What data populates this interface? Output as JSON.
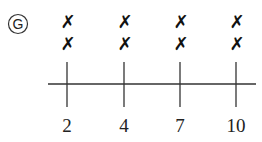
{
  "option_label": "G",
  "line_plot": {
    "axis": {
      "x_start": 48,
      "x_end": 256,
      "y": 84
    },
    "ticks": [
      {
        "label": "2",
        "x": 67,
        "count": 2
      },
      {
        "label": "4",
        "x": 124,
        "count": 2
      },
      {
        "label": "7",
        "x": 180,
        "count": 2
      },
      {
        "label": "10",
        "x": 236,
        "count": 2
      }
    ],
    "mark_symbol": "✗"
  },
  "chart_data": {
    "type": "scatter",
    "title": "",
    "categories": [
      "2",
      "4",
      "7",
      "10"
    ],
    "values": [
      2,
      2,
      2,
      2
    ],
    "xlabel": "",
    "ylabel": ""
  }
}
